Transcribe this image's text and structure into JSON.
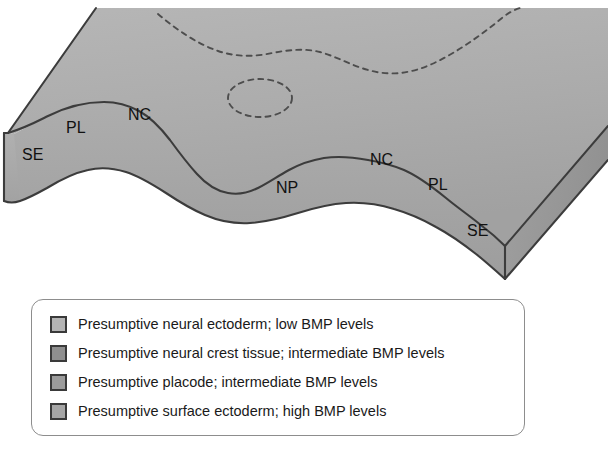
{
  "figure": {
    "name": "neural-plate-border-3d-diagram",
    "colors": {
      "surface_top": "#aeaeae",
      "surface_front": "#a4a4a4",
      "surface_side": "#9a9a9a",
      "outline": "#3c3c3c",
      "dashed": "#4a4a4a",
      "legend_border": "#8d8d8d",
      "swatch_border": "#3a3a3a",
      "text": "#1a1a1a",
      "background": "#ffffff"
    },
    "region_labels": [
      {
        "text": "SE",
        "x": 22,
        "y": 160
      },
      {
        "text": "PL",
        "x": 66,
        "y": 133
      },
      {
        "text": "NC",
        "x": 128,
        "y": 120
      },
      {
        "text": "NP",
        "x": 276,
        "y": 193
      },
      {
        "text": "NC",
        "x": 370,
        "y": 165
      },
      {
        "text": "PL",
        "x": 428,
        "y": 190
      },
      {
        "text": "SE",
        "x": 467,
        "y": 236
      }
    ]
  },
  "legend": {
    "items": [
      {
        "label": "Presumptive neural ectoderm; low BMP levels",
        "swatch_color": "#b4b4b4",
        "swatch_name": "legend-swatch-neural-ectoderm"
      },
      {
        "label": "Presumptive neural crest tissue; intermediate BMP levels",
        "swatch_color": "#8f8f8f",
        "swatch_name": "legend-swatch-neural-crest"
      },
      {
        "label": "Presumptive placode; intermediate BMP levels",
        "swatch_color": "#9c9c9c",
        "swatch_name": "legend-swatch-placode"
      },
      {
        "label": "Presumptive surface ectoderm; high BMP levels",
        "swatch_color": "#a6a6a6",
        "swatch_name": "legend-swatch-surface-ectoderm"
      }
    ]
  }
}
